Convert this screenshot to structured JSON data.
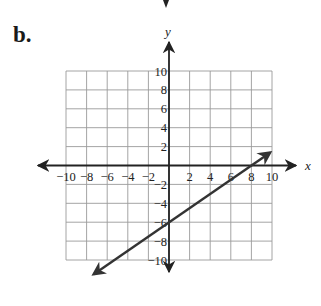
{
  "problem_label": "b.",
  "chart_data": {
    "type": "line",
    "title": "",
    "xlabel": "x",
    "ylabel": "y",
    "xlim": [
      -10,
      10
    ],
    "ylim": [
      -10,
      10
    ],
    "grid": true,
    "x_ticks": [
      -10,
      -8,
      -6,
      -4,
      -2,
      2,
      4,
      6,
      8,
      10
    ],
    "y_ticks": [
      10,
      8,
      6,
      4,
      2,
      -2,
      -4,
      -6,
      -8,
      -10
    ],
    "series": [
      {
        "name": "line",
        "equation": "y = 0.75x - 6",
        "slope": 0.75,
        "y_intercept": -6,
        "x_intercept": 8,
        "x": [
          -7.3,
          9.8
        ],
        "y": [
          -11.5,
          1.35
        ],
        "arrows": "both"
      }
    ]
  }
}
